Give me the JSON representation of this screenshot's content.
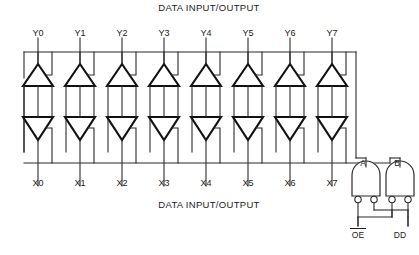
{
  "diagram": {
    "title_top": "DATA  INPUT/OUTPUT",
    "title_bottom": "DATA  INPUT/OUTPUT",
    "type": "octal-bus-transceiver-logic-diagram",
    "colors": {
      "ink": "#1a1a1a",
      "wire": "#2b2b2b",
      "buffer_stroke": "#111111",
      "background": "#ffffff"
    },
    "channel_count": 8,
    "channels": [
      {
        "index": 0,
        "y_label": "Y0",
        "x_label": "X0"
      },
      {
        "index": 1,
        "y_label": "Y1",
        "x_label": "X1"
      },
      {
        "index": 2,
        "y_label": "Y2",
        "x_label": "X2"
      },
      {
        "index": 3,
        "y_label": "Y3",
        "x_label": "X3"
      },
      {
        "index": 4,
        "y_label": "Y4",
        "x_label": "X4"
      },
      {
        "index": 5,
        "y_label": "Y5",
        "x_label": "X5"
      },
      {
        "index": 6,
        "y_label": "Y6",
        "x_label": "X6"
      },
      {
        "index": 7,
        "y_label": "Y7",
        "x_label": "X7"
      }
    ],
    "gates": [
      {
        "id": "A",
        "label": "A",
        "kind": "and-gate",
        "inputs_inverted": 2
      },
      {
        "id": "B",
        "label": "B",
        "kind": "and-gate",
        "inputs_inverted": 2
      }
    ],
    "control_pins": [
      {
        "label": "OE",
        "overbar": true
      },
      {
        "label": "DD",
        "overbar": false
      }
    ],
    "buffers": {
      "top_row_direction": "up",
      "bottom_row_direction": "down",
      "top_row_count": 8,
      "bottom_row_count": 8
    }
  }
}
